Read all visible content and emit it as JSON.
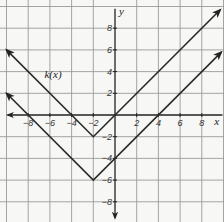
{
  "chart_data": {
    "type": "line",
    "title": "",
    "xlabel": "x",
    "ylabel": "y",
    "xlim": [
      -10,
      10
    ],
    "ylim": [
      -10,
      10
    ],
    "grid": true,
    "grid_step": 2,
    "x_ticks": [
      -8,
      -6,
      -4,
      -2,
      2,
      4,
      6,
      8
    ],
    "y_ticks": [
      8,
      6,
      4,
      2,
      -2,
      -4,
      -6,
      -8
    ],
    "x_tick_labels": [
      "−8",
      "−6",
      "−4",
      "−2",
      "2",
      "4",
      "6",
      "8"
    ],
    "y_tick_labels": [
      "8",
      "6",
      "4",
      "2",
      "−2",
      "−4",
      "−6",
      "−8"
    ],
    "series": [
      {
        "name": "k(x)",
        "label": "k(x)",
        "equation": "|x + 2| − 2",
        "vertex": [
          -2,
          -2
        ],
        "x": [
          -10,
          -2,
          9.7
        ],
        "y": [
          6,
          -2,
          9.7
        ],
        "arrows": "both"
      },
      {
        "name": "unlabeled",
        "label": "",
        "equation": "|x + 2| − 6",
        "vertex": [
          -2,
          -6
        ],
        "x": [
          -10,
          -2,
          9.8
        ],
        "y": [
          2,
          -6,
          5.8
        ],
        "arrows": "both"
      }
    ],
    "annotations": [
      {
        "text": "k(x)",
        "x": -6.5,
        "y": 3.4
      }
    ],
    "colors": {
      "grid": "#9a9a9a",
      "axes": "#222222",
      "lines": "#2a2a2a",
      "background": "#f7f7f5"
    }
  }
}
